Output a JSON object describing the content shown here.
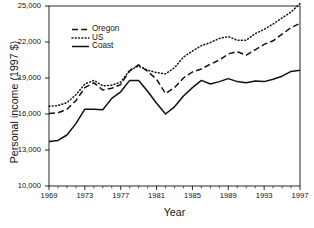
{
  "chart_data": {
    "type": "line",
    "title": "",
    "xlabel": "Year",
    "ylabel": "Personal income (1997 $)",
    "xlim": [
      1969,
      1997
    ],
    "ylim": [
      10000,
      25000
    ],
    "grid": false,
    "legend_position": "top-left",
    "x": [
      1969,
      1970,
      1971,
      1972,
      1973,
      1974,
      1975,
      1976,
      1977,
      1978,
      1979,
      1980,
      1981,
      1982,
      1983,
      1984,
      1985,
      1986,
      1987,
      1988,
      1989,
      1990,
      1991,
      1992,
      1993,
      1994,
      1995,
      1996,
      1997
    ],
    "xticks": [
      1969,
      1973,
      1977,
      1981,
      1985,
      1989,
      1993,
      1997
    ],
    "xtick_labels": [
      "1969",
      "1973",
      "1977",
      "1981",
      "1985",
      "1989",
      "1993",
      "1997"
    ],
    "yticks": [
      10000,
      13000,
      16000,
      19000,
      22000,
      25000
    ],
    "ytick_labels": [
      "10,000",
      "13,000",
      "16,000",
      "19,000",
      "22,000",
      "25,000"
    ],
    "series": [
      {
        "name": "Oregon",
        "style": "dashed",
        "color": "#111111",
        "values": [
          16050,
          16100,
          16400,
          17100,
          18200,
          18600,
          18000,
          18150,
          18450,
          19600,
          20100,
          19550,
          18900,
          17700,
          18200,
          19000,
          19500,
          19750,
          20150,
          20500,
          21000,
          21200,
          20900,
          21350,
          21800,
          22100,
          22650,
          23200,
          23550
        ]
      },
      {
        "name": "US",
        "style": "dotted",
        "color": "#111111",
        "values": [
          16650,
          16700,
          16950,
          17600,
          18500,
          18800,
          18350,
          18400,
          18650,
          19650,
          20000,
          19650,
          19450,
          19350,
          19850,
          20750,
          21250,
          21700,
          21950,
          22300,
          22450,
          22150,
          22150,
          22700,
          23050,
          23500,
          24000,
          24500,
          25200
        ]
      },
      {
        "name": "Coast",
        "style": "solid",
        "color": "#111111",
        "values": [
          13700,
          13800,
          14250,
          15200,
          16400,
          16400,
          16350,
          17300,
          17850,
          18800,
          18800,
          17900,
          16900,
          16000,
          16600,
          17500,
          18200,
          18800,
          18500,
          18700,
          18950,
          18700,
          18600,
          18750,
          18700,
          18900,
          19150,
          19550,
          19650
        ]
      }
    ]
  },
  "legend": {
    "items": [
      {
        "label": "Oregon",
        "style": "dashed"
      },
      {
        "label": "US",
        "style": "dotted"
      },
      {
        "label": "Coast",
        "style": "solid"
      }
    ]
  }
}
